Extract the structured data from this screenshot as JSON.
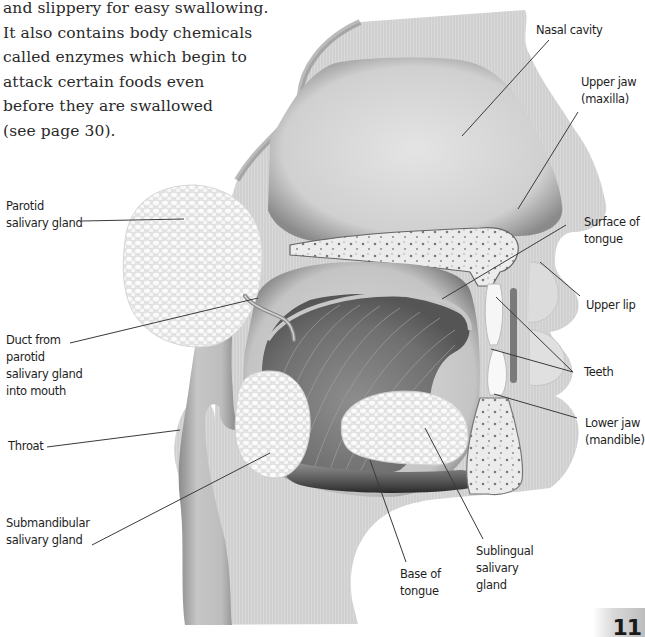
{
  "body_text": {
    "lines": [
      "and slippery for easy swallowing.",
      "It also contains body chemicals",
      "called enzymes which begin to",
      "attack certain foods even",
      "before they are swallowed",
      "(see page 30)."
    ]
  },
  "diagram": {
    "labels": {
      "nasal_cavity": "Nasal cavity",
      "upper_jaw": [
        "Upper jaw",
        "(maxilla)"
      ],
      "parotid": [
        "Parotid",
        "salivary gland"
      ],
      "surface_tongue": [
        "Surface of",
        "tongue"
      ],
      "upper_lip": "Upper lip",
      "duct": [
        "Duct from",
        "parotid",
        "salivary gland",
        "into mouth"
      ],
      "teeth": "Teeth",
      "lower_jaw": [
        "Lower jaw",
        "(mandible)"
      ],
      "throat": "Throat",
      "submandibular": [
        "Submandibular",
        "salivary gland"
      ],
      "base_tongue": [
        "Base of",
        "tongue"
      ],
      "sublingual": [
        "Sublingual",
        "salivary",
        "gland"
      ]
    }
  },
  "page": {
    "number": "11"
  }
}
